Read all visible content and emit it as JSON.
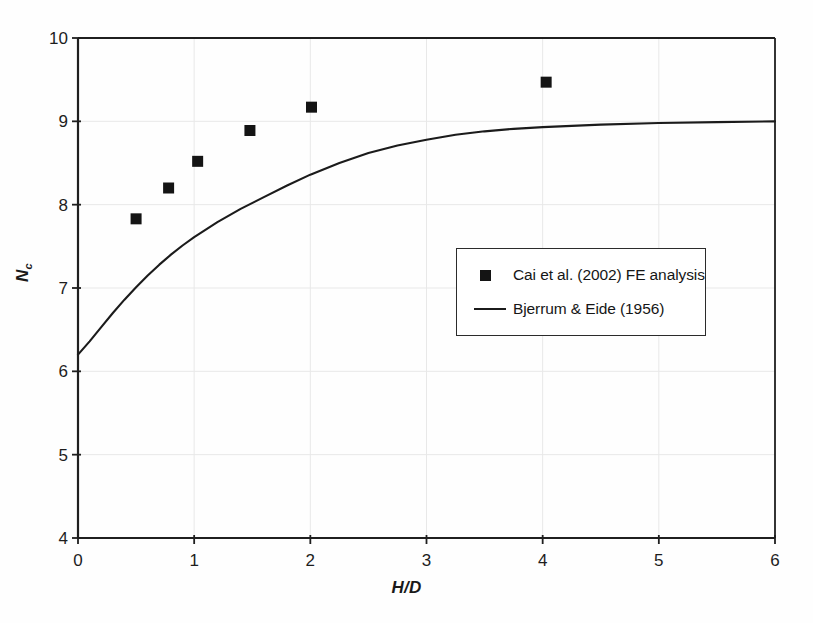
{
  "chart_data": {
    "type": "scatter",
    "title": "",
    "xlabel": "H/D",
    "ylabel": "Nc",
    "ylabel_base": "N",
    "ylabel_sub": "c",
    "xlim": [
      0,
      6
    ],
    "ylim": [
      4,
      10
    ],
    "xticks": [
      0,
      1,
      2,
      3,
      4,
      5,
      6
    ],
    "yticks": [
      4,
      5,
      6,
      7,
      8,
      9,
      10
    ],
    "xtick_labels": [
      "0",
      "1",
      "2",
      "3",
      "4",
      "5",
      "6"
    ],
    "ytick_labels": [
      "4",
      "5",
      "6",
      "7",
      "8",
      "9",
      "10"
    ],
    "grid": true,
    "grid_color": "#e8e8e8",
    "axis_color": "#1f1f1f",
    "legend_position": "center-right",
    "series": [
      {
        "name": "Cai et al. (2002) FE analysis",
        "type": "scatter",
        "marker": "square",
        "color": "#141414",
        "points": [
          {
            "x": 0.5,
            "y": 7.83
          },
          {
            "x": 0.78,
            "y": 8.2
          },
          {
            "x": 1.03,
            "y": 8.52
          },
          {
            "x": 1.48,
            "y": 8.89
          },
          {
            "x": 2.01,
            "y": 9.17
          },
          {
            "x": 4.03,
            "y": 9.47
          }
        ]
      },
      {
        "name": "Bjerrum & Eide (1956)",
        "type": "line",
        "color": "#1b1b1b",
        "points": [
          {
            "x": 0.0,
            "y": 6.2
          },
          {
            "x": 0.1,
            "y": 6.36
          },
          {
            "x": 0.2,
            "y": 6.53
          },
          {
            "x": 0.3,
            "y": 6.7
          },
          {
            "x": 0.4,
            "y": 6.86
          },
          {
            "x": 0.5,
            "y": 7.01
          },
          {
            "x": 0.6,
            "y": 7.15
          },
          {
            "x": 0.7,
            "y": 7.28
          },
          {
            "x": 0.8,
            "y": 7.4
          },
          {
            "x": 0.9,
            "y": 7.51
          },
          {
            "x": 1.0,
            "y": 7.61
          },
          {
            "x": 1.2,
            "y": 7.79
          },
          {
            "x": 1.4,
            "y": 7.95
          },
          {
            "x": 1.6,
            "y": 8.09
          },
          {
            "x": 1.8,
            "y": 8.23
          },
          {
            "x": 2.0,
            "y": 8.36
          },
          {
            "x": 2.25,
            "y": 8.5
          },
          {
            "x": 2.5,
            "y": 8.62
          },
          {
            "x": 2.75,
            "y": 8.71
          },
          {
            "x": 3.0,
            "y": 8.78
          },
          {
            "x": 3.25,
            "y": 8.84
          },
          {
            "x": 3.5,
            "y": 8.88
          },
          {
            "x": 3.75,
            "y": 8.91
          },
          {
            "x": 4.0,
            "y": 8.93
          },
          {
            "x": 4.5,
            "y": 8.96
          },
          {
            "x": 5.0,
            "y": 8.98
          },
          {
            "x": 5.5,
            "y": 8.99
          },
          {
            "x": 6.0,
            "y": 9.0
          }
        ]
      }
    ],
    "legend": [
      {
        "label": "Cai et al. (2002) FE analysis",
        "marker": "square"
      },
      {
        "label": "Bjerrum & Eide (1956)",
        "marker": "line"
      }
    ]
  }
}
